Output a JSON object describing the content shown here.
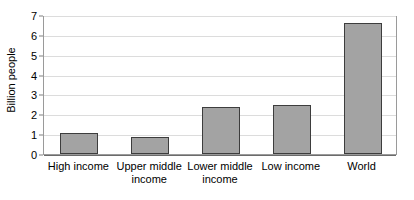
{
  "chart_data": {
    "type": "bar",
    "title": "",
    "xlabel": "",
    "ylabel": "Billion people",
    "categories": [
      "High income",
      "Upper middle income",
      "Lower middle income",
      "Low income",
      "World"
    ],
    "values": [
      1.05,
      0.85,
      2.35,
      2.45,
      6.6
    ],
    "ylim": [
      0,
      7
    ],
    "ytick_labels": [
      "0",
      "1",
      "2",
      "3",
      "4",
      "5",
      "6",
      "7"
    ],
    "ytick_values": [
      0,
      1,
      2,
      3,
      4,
      5,
      6,
      7
    ],
    "grid": true,
    "legend": false,
    "legend_position": "none",
    "colors": {
      "bar_fill": "#a3a3a3",
      "bar_border": "#3d3d3d",
      "gridline": "#dcdcdc",
      "axis": "#6b6b6b",
      "text": "#000000",
      "background": "#ffffff"
    }
  }
}
